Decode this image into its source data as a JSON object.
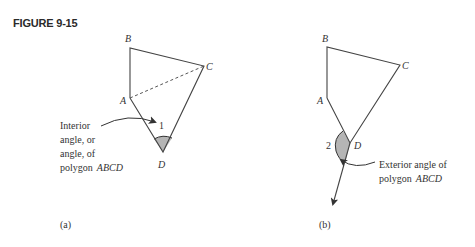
{
  "figure": {
    "title": "FIGURE 9-15"
  },
  "panel_a": {
    "caption": "(a)",
    "vertices": {
      "A": "A",
      "B": "B",
      "C": "C",
      "D": "D"
    },
    "angle_label": "1",
    "annotation": {
      "line1": "Interior",
      "line2": "angle, or",
      "line3": "angle, of",
      "line4_prefix": "polygon",
      "line4_name": "ABCD"
    }
  },
  "panel_b": {
    "caption": "(b)",
    "vertices": {
      "A": "A",
      "B": "B",
      "C": "C",
      "D": "D"
    },
    "angle_label": "2",
    "annotation": {
      "line1": "Exterior angle of",
      "line2_prefix": "polygon",
      "line2_name": "ABCD"
    }
  },
  "colors": {
    "line": "#444444",
    "shade": "#b5b5b5",
    "text": "#333333"
  }
}
